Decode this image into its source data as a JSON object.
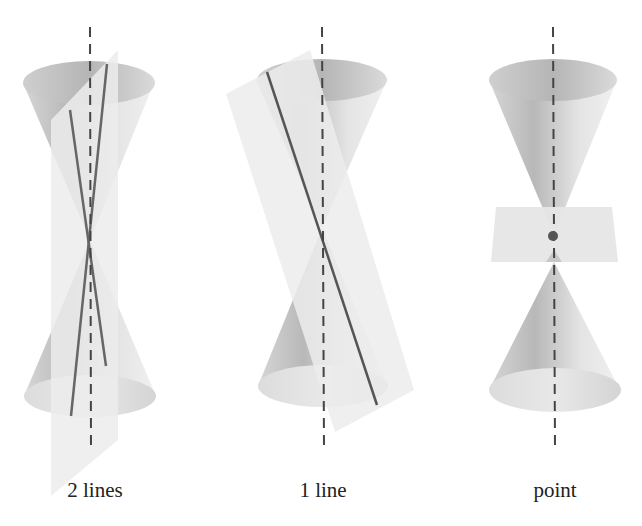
{
  "panels": [
    {
      "id": "two-lines",
      "label": "2 lines",
      "description": "Plane containing the axis cuts the double cone in two intersecting lines"
    },
    {
      "id": "one-line",
      "label": "1 line",
      "description": "Plane tangent to the cone along a single generating line"
    },
    {
      "id": "point",
      "label": "point",
      "description": "Horizontal plane through the vertex meets the cone in a single point"
    }
  ],
  "colors": {
    "background": "#ffffff",
    "cone_light": "#e6e6e6",
    "cone_dark": "#a9a9a9",
    "plane": "#e9e9e9",
    "line": "#666666",
    "axis": "#444444"
  }
}
